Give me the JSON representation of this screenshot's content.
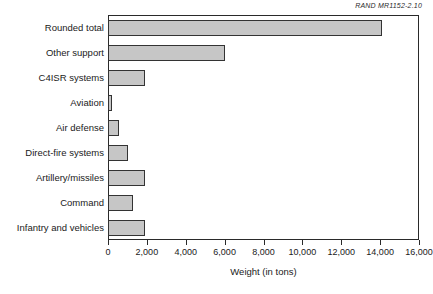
{
  "source_credit": "RAND MR1152-2.10",
  "axis": {
    "x_title": "Weight (in tons)",
    "x_ticks": [
      "0",
      "2,000",
      "4,000",
      "6,000",
      "8,000",
      "10,000",
      "12,000",
      "14,000",
      "16,000"
    ]
  },
  "colors": {
    "bar_fill": "#c6c6c6",
    "bar_stroke": "#333333",
    "frame": "#2a2a2a",
    "background": "#ffffff",
    "text": "#1a1a1a"
  },
  "chart_data": {
    "type": "bar",
    "orientation": "horizontal",
    "title": "",
    "subtitle": "",
    "xlabel": "Weight (in tons)",
    "ylabel": "",
    "xlim": [
      0,
      16000
    ],
    "xticks": [
      0,
      2000,
      4000,
      6000,
      8000,
      10000,
      12000,
      14000,
      16000
    ],
    "grid": false,
    "legend": null,
    "annotations": [
      "RAND MR1152-2.10"
    ],
    "categories": [
      "Rounded total",
      "Other support",
      "C4ISR systems",
      "Aviation",
      "Air defense",
      "Direct-fire systems",
      "Artillery/missiles",
      "Command",
      "Infantry and vehicles"
    ],
    "values": [
      14100,
      6000,
      1900,
      200,
      550,
      1050,
      1900,
      1300,
      1900
    ]
  }
}
